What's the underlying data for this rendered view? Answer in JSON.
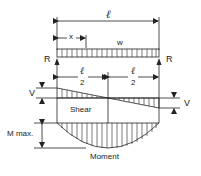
{
  "diagram": {
    "span_label": "ℓ",
    "x_label": "x",
    "load_label": "w",
    "reaction_left": "R",
    "reaction_right": "R",
    "half_span_left": {
      "numerator": "ℓ",
      "denominator": "2"
    },
    "half_span_right": {
      "numerator": "ℓ",
      "denominator": "2"
    },
    "shear_label": "Shear",
    "shear_left_value": "V",
    "shear_right_value": "V",
    "moment_label": "Moment",
    "moment_max_label": "M max."
  },
  "colors": {
    "line": "#222222",
    "background": "#ffffff"
  }
}
